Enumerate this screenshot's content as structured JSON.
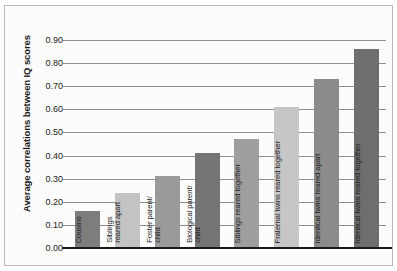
{
  "chart_data": {
    "type": "bar",
    "title": "",
    "subtitle": "",
    "xlabel": "",
    "ylabel": "Average correlations between IQ scores",
    "ylim": [
      0.0,
      0.9
    ],
    "ytick_step": 0.1,
    "ytick_labels": [
      "0.00",
      "0.10",
      "0.20",
      "0.30",
      "0.40",
      "0.50",
      "0.60",
      "0.70",
      "0.80",
      "0.90"
    ],
    "ytick_values": [
      0.0,
      0.1,
      0.2,
      0.3,
      0.4,
      0.5,
      0.6,
      0.7,
      0.8,
      0.9
    ],
    "grid": true,
    "grid_axis": "y",
    "legend": false,
    "legend_position": "none",
    "categories": [
      "Cousins",
      "Siblings\nreared apart",
      "Foster parent/\nchild",
      "Biological parent/\nchild",
      "Siblings reared together",
      "Fraternal twins reared together",
      "Identical twins reared apart",
      "Identical twins reared together"
    ],
    "values": [
      0.16,
      0.24,
      0.31,
      0.41,
      0.47,
      0.61,
      0.73,
      0.86
    ],
    "bar_colors": [
      "#7d7d7d",
      "#c3c3c3",
      "#9a9a9a",
      "#757575",
      "#9e9e9e",
      "#c6c6c6",
      "#8b8b8b",
      "#6e6e6e"
    ]
  },
  "axis": {
    "grid_color": "#8f8f8f",
    "baseline_color": "#1a1a1a",
    "frame_color": "#b9b9b9",
    "background": "#fcfcfc"
  }
}
